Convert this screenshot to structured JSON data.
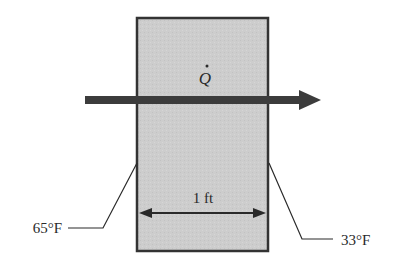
{
  "diagram": {
    "type": "plane-wall-conduction",
    "heat_flow_label": "Q",
    "heat_flow_direction": "left-to-right",
    "thickness_label": "1 ft",
    "left_temperature_label": "65°F",
    "right_temperature_label": "33°F",
    "colors": {
      "slab_fill": "#cfcfcf",
      "slab_border": "#333333",
      "arrow": "#3c3c3c",
      "line": "#2a2a2a"
    }
  }
}
